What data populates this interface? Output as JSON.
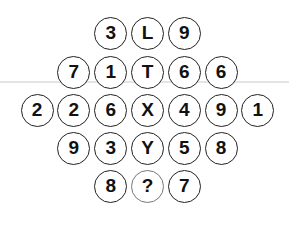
{
  "puzzle": {
    "rows": [
      [
        "3",
        "L",
        "9"
      ],
      [
        "7",
        "1",
        "T",
        "6",
        "6"
      ],
      [
        "2",
        "2",
        "6",
        "X",
        "4",
        "9",
        "1"
      ],
      [
        "9",
        "3",
        "Y",
        "5",
        "8"
      ],
      [
        "8",
        "?",
        "7"
      ]
    ]
  }
}
